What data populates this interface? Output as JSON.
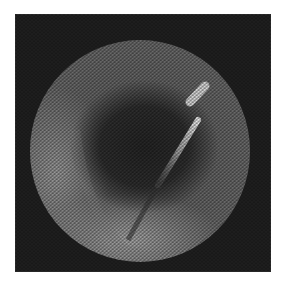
{
  "image": {
    "description": "Grayscale fiberscope endoscopic view with circular field and bright diagonal instrument",
    "colors": {
      "background": "#ffffff",
      "frame": "#1e1e1e",
      "field_dark": "#2a2a2a",
      "field_mid": "#6e6e6e",
      "field_bright": "#a8a8a8",
      "instrument": "#e6e6e6"
    }
  }
}
